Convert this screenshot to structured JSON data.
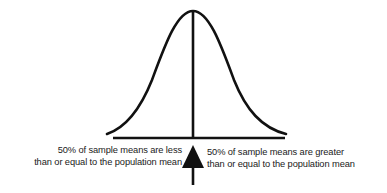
{
  "diagram": {
    "type": "normal-distribution",
    "colors": {
      "stroke": "#111111",
      "background": "#ffffff"
    },
    "left_annotation": {
      "line1": "50% of sample means are less",
      "line2": "than or equal to the population mean"
    },
    "right_annotation": {
      "line1": "50% of sample means are greater",
      "line2": "than or equal to the population mean"
    },
    "arrow": {
      "direction": "up",
      "points_to": "population-mean"
    }
  }
}
